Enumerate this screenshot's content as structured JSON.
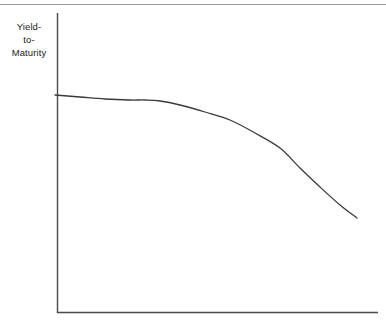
{
  "figure": {
    "name": "inverted-yield-curve-diagram",
    "top_rule_color": "#9a9a9a"
  },
  "labels": {
    "y_axis_line1": "Yield-",
    "y_axis_line2": "to-",
    "y_axis_line3": "Maturity",
    "y_axis_full": "Yield-to-Maturity",
    "x_axis": ""
  },
  "chart_data": {
    "type": "line",
    "title": "",
    "subtitle": "",
    "xlabel": "",
    "ylabel": "Yield-to-Maturity",
    "grid": false,
    "legend": false,
    "axis_color": "#4a4a4a",
    "line_color": "#3a3a3a",
    "line_width": 1.3,
    "axis_origin_px": [
      57,
      313
    ],
    "x_axis_end_px": [
      378,
      313
    ],
    "y_axis_top_px": [
      57,
      13
    ],
    "xlim": [
      0,
      1
    ],
    "ylim": [
      0,
      1
    ],
    "note": "Downward sloping (inverted) yield curve: high short-term yields declining with maturity; nearly flat at the short end, steepening toward the long end.",
    "series": [
      {
        "name": "Yield curve",
        "x_px": [
          55,
          80,
          105,
          130,
          145,
          160,
          180,
          205,
          230,
          255,
          280,
          300,
          320,
          340,
          357
        ],
        "y_px": [
          95,
          97,
          99,
          100,
          100,
          101,
          105,
          112,
          120,
          133,
          148,
          168,
          187,
          205,
          218
        ],
        "x": [
          0.0,
          0.08,
          0.16,
          0.23,
          0.28,
          0.32,
          0.39,
          0.46,
          0.54,
          0.62,
          0.7,
          0.76,
          0.82,
          0.88,
          0.94
        ],
        "y": [
          0.73,
          0.72,
          0.71,
          0.71,
          0.71,
          0.71,
          0.69,
          0.67,
          0.64,
          0.6,
          0.55,
          0.48,
          0.42,
          0.36,
          0.32
        ]
      }
    ]
  }
}
